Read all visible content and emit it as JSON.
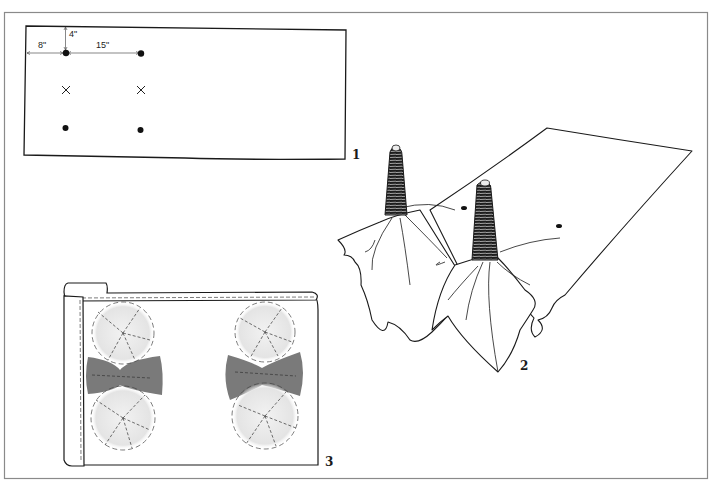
{
  "figure": {
    "frame_color": "#8a8a8a",
    "ink_color": "#1a1a1a",
    "dye_color": "#7a7a7a",
    "light_dye_color": "#e6e6e6"
  },
  "panels": [
    {
      "number": "1",
      "description": "Flat cloth layout with tie points",
      "dimensions": {
        "left_margin": "8\"",
        "top_margin": "4\"",
        "spacing": "15\""
      },
      "markers": [
        {
          "type": "dot",
          "row": 1,
          "col": 1
        },
        {
          "type": "dot",
          "row": 1,
          "col": 2
        },
        {
          "type": "cross",
          "row": 2,
          "col": 1
        },
        {
          "type": "cross",
          "row": 2,
          "col": 2
        },
        {
          "type": "dot",
          "row": 3,
          "col": 1
        },
        {
          "type": "dot",
          "row": 3,
          "col": 2
        }
      ]
    },
    {
      "number": "2",
      "description": "Cloth gathered and bound into two thread-wrapped cones"
    },
    {
      "number": "3",
      "description": "Finished dyed cloth on roll showing circular tie-dye patterns"
    }
  ]
}
